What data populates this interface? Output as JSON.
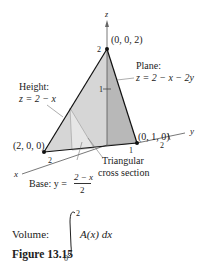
{
  "figure": {
    "axes": {
      "z": "z",
      "x": "x",
      "y": "y"
    },
    "ticks": {
      "z2": "2",
      "z1": "1",
      "x2": "2",
      "y1": "1",
      "y2": "2"
    },
    "points": {
      "top": "(0, 0, 2)",
      "x_int": "(2, 0, 0)",
      "y_int": "(0, 1, 0)"
    },
    "plane_label": "Plane:",
    "plane_eq": "z = 2 − x − 2y",
    "height_label": "Height:",
    "height_eq": "z = 2 − x",
    "base_label": "Base: y =",
    "base_num": "2 − x",
    "base_den": "2",
    "cross_line1": "Triangular",
    "cross_line2": "cross section"
  },
  "volume": {
    "label": "Volume:",
    "upper": "2",
    "lower": "0",
    "integrand": "A(x) dx"
  },
  "caption": "Figure 13.15"
}
